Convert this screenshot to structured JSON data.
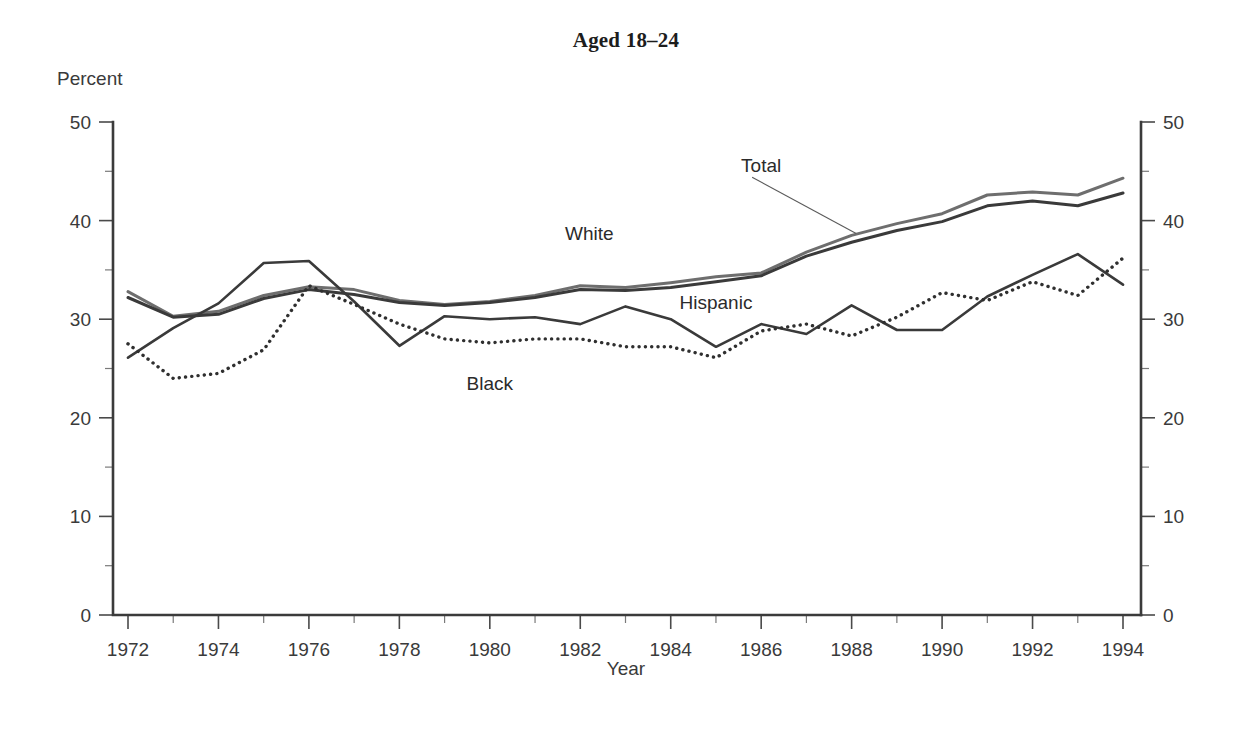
{
  "chart_data": {
    "type": "line",
    "title": "Aged 18–24",
    "xlabel": "Year",
    "ylabel": "Percent",
    "xlim": [
      1972,
      1994
    ],
    "ylim": [
      0,
      50
    ],
    "ytick_labels": [
      "0",
      "10",
      "20",
      "30",
      "40",
      "50"
    ],
    "ytick_values": [
      0,
      10,
      20,
      30,
      40,
      50
    ],
    "yminor_values": [
      5,
      15,
      25,
      35,
      45
    ],
    "xtick_labels": [
      "1972",
      "1974",
      "1976",
      "1978",
      "1980",
      "1982",
      "1984",
      "1986",
      "1988",
      "1990",
      "1992",
      "1994"
    ],
    "xtick_values": [
      1972,
      1974,
      1976,
      1978,
      1980,
      1982,
      1984,
      1986,
      1988,
      1990,
      1992,
      1994
    ],
    "xminor_values": [
      1973,
      1975,
      1977,
      1979,
      1981,
      1983,
      1985,
      1987,
      1989,
      1991,
      1993
    ],
    "grid": false,
    "dual_y_axis": true,
    "legend": "inline-annotations",
    "x": [
      1972,
      1973,
      1974,
      1975,
      1976,
      1977,
      1978,
      1979,
      1980,
      1981,
      1982,
      1983,
      1984,
      1985,
      1986,
      1987,
      1988,
      1989,
      1990,
      1991,
      1992,
      1993,
      1994
    ],
    "series": [
      {
        "name": "White",
        "color": "#6e6e6e",
        "style": "solid",
        "width": 3.0,
        "label_x": 1982.2,
        "label_y": 38.6,
        "values": [
          32.8,
          30.3,
          30.8,
          32.4,
          33.3,
          33.0,
          31.9,
          31.5,
          31.8,
          32.4,
          33.4,
          33.2,
          33.7,
          34.3,
          34.7,
          36.8,
          38.5,
          39.7,
          40.7,
          42.6,
          42.9,
          42.6,
          44.3
        ]
      },
      {
        "name": "Total",
        "color": "#3a3a3a",
        "style": "solid",
        "width": 3.0,
        "label_x": 1986.0,
        "label_y": 45.5,
        "values": [
          32.2,
          30.2,
          30.5,
          32.1,
          33.0,
          32.5,
          31.7,
          31.4,
          31.7,
          32.2,
          33.0,
          32.9,
          33.2,
          33.8,
          34.4,
          36.4,
          37.8,
          39.0,
          39.9,
          41.5,
          42.0,
          41.5,
          42.8
        ]
      },
      {
        "name": "Hispanic",
        "color": "#3a3a3a",
        "style": "solid",
        "width": 2.6,
        "label_x": 1985.0,
        "label_y": 31.6,
        "values": [
          26.1,
          29.1,
          31.6,
          35.7,
          35.9,
          31.8,
          27.3,
          30.3,
          30.0,
          30.2,
          29.5,
          31.3,
          30.0,
          27.2,
          29.5,
          28.5,
          31.4,
          28.9,
          28.9,
          32.3,
          34.5,
          36.6,
          33.5
        ]
      },
      {
        "name": "Black",
        "color": "#2f2f2f",
        "style": "dotted",
        "width": 3.4,
        "label_x": 1980.0,
        "label_y": 23.4,
        "values": [
          27.5,
          24.0,
          24.5,
          26.9,
          33.4,
          31.5,
          29.5,
          28.0,
          27.6,
          28.0,
          28.0,
          27.2,
          27.2,
          26.1,
          28.8,
          29.5,
          28.3,
          30.2,
          32.7,
          31.9,
          33.8,
          32.4,
          36.2
        ]
      }
    ],
    "annotations": [
      {
        "name": "total-leader-line",
        "from_x": 1985.8,
        "from_y": 44.4,
        "to_x": 1988.1,
        "to_y": 38.7
      }
    ]
  }
}
